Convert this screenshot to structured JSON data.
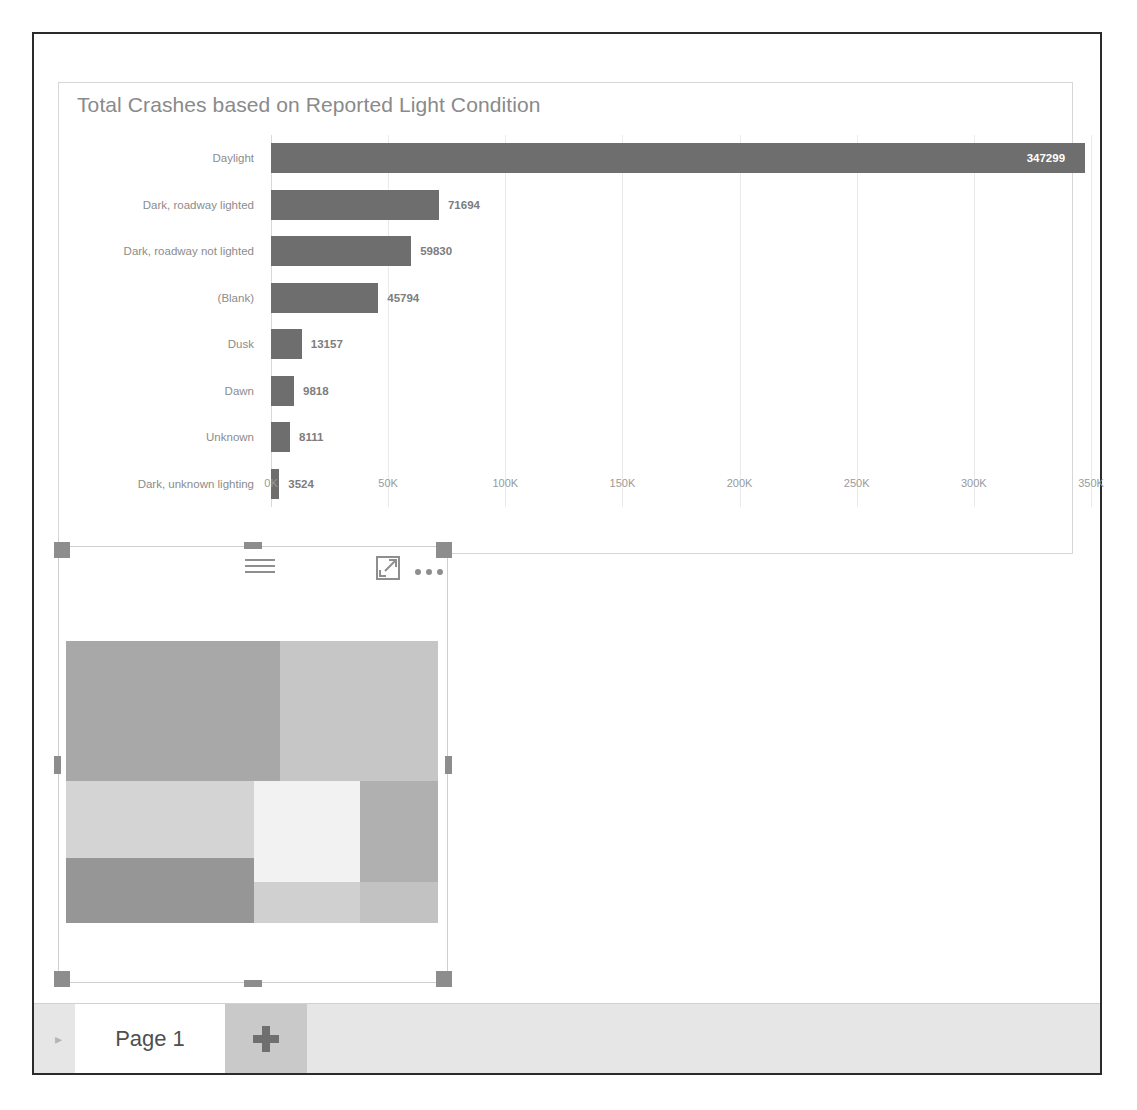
{
  "report": {
    "page_tab_label": "Page 1",
    "add_page_label": "+",
    "nav_arrow_glyph": "▸"
  },
  "bar_visual": {
    "title": "Total Crashes based on Reported Light Condition",
    "header_icons": {
      "filter": "filter-icon",
      "focus": "focus-mode-icon",
      "more": "more-options-icon"
    }
  },
  "treemap_visual": {
    "header_icons": {
      "filter": "filter-icon",
      "focus": "focus-mode-icon",
      "more": "more-options-icon"
    },
    "tiles": [
      {
        "name": "tile-1",
        "color": "#a8a8a8",
        "x": 0,
        "y": 0,
        "w": 57.5,
        "h": 49.5
      },
      {
        "name": "tile-2",
        "color": "#c6c6c6",
        "x": 57.5,
        "y": 0,
        "w": 42.5,
        "h": 49.5
      },
      {
        "name": "tile-3",
        "color": "#d4d4d4",
        "x": 0,
        "y": 49.5,
        "w": 50.5,
        "h": 27.5
      },
      {
        "name": "tile-4",
        "color": "#f2f2f2",
        "x": 50.5,
        "y": 49.5,
        "w": 28.5,
        "h": 36.0
      },
      {
        "name": "tile-5",
        "color": "#b0b0b0",
        "x": 79.0,
        "y": 49.5,
        "w": 21.0,
        "h": 36.0
      },
      {
        "name": "tile-6",
        "color": "#969696",
        "x": 0,
        "y": 77.0,
        "w": 50.5,
        "h": 23.0
      },
      {
        "name": "tile-7",
        "color": "#d0d0d0",
        "x": 50.5,
        "y": 85.5,
        "w": 28.5,
        "h": 14.5
      },
      {
        "name": "tile-8",
        "color": "#c2c2c2",
        "x": 79.0,
        "y": 85.5,
        "w": 21.0,
        "h": 14.5
      }
    ]
  },
  "chart_data": {
    "type": "bar",
    "orientation": "horizontal",
    "title": "Total Crashes based on Reported Light Condition",
    "xlabel": "",
    "ylabel": "",
    "categories": [
      "Daylight",
      "Dark, roadway lighted",
      "Dark, roadway not lighted",
      "(Blank)",
      "Dusk",
      "Dawn",
      "Unknown",
      "Dark, unknown lighting"
    ],
    "values": [
      347299,
      71694,
      59830,
      45794,
      13157,
      9818,
      8111,
      3524
    ],
    "value_labels": [
      "347299",
      "71694",
      "59830",
      "45794",
      "13157",
      "9818",
      "8111",
      "3524"
    ],
    "label_inside": [
      true,
      false,
      false,
      false,
      false,
      false,
      false,
      false
    ],
    "xlim": [
      0,
      350000
    ],
    "xticks": [
      0,
      50000,
      100000,
      150000,
      200000,
      250000,
      300000,
      350000
    ],
    "xtick_labels": [
      "0K",
      "50K",
      "100K",
      "150K",
      "200K",
      "250K",
      "300K",
      "350K"
    ],
    "grid": true,
    "legend": "none",
    "bar_color": "#6e6e6e"
  }
}
